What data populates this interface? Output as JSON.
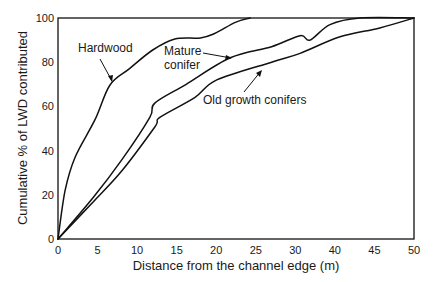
{
  "chart_data": {
    "type": "line",
    "title": "",
    "xlabel": "Distance from the channel edge (m)",
    "ylabel": "Cumulative % of LWD contributed",
    "xlim": [
      0,
      50
    ],
    "ylim": [
      0,
      100
    ],
    "grid": false,
    "legend": "none (direct annotations with arrows)",
    "x_tick_labels": [
      "0",
      "5",
      "10",
      "15",
      "20",
      "25",
      "30",
      "40",
      "45",
      "50"
    ],
    "y_tick_labels": [
      "0",
      "20",
      "40",
      "60",
      "80",
      "100"
    ],
    "series": [
      {
        "name": "Hardwood",
        "x": [
          0,
          1,
          2.4,
          5.2,
          7.3,
          10,
          13.3,
          16.4,
          20,
          22,
          24.9,
          27
        ],
        "y": [
          0,
          22,
          37,
          54,
          69.7,
          77,
          85.5,
          90.5,
          91,
          93,
          98,
          100
        ]
      },
      {
        "name": "Mature conifer",
        "x": [
          0,
          5,
          9,
          12.9,
          13.6,
          18,
          24.2,
          30,
          34,
          35.4,
          38.2,
          42.4,
          50
        ],
        "y": [
          0,
          19,
          36,
          55,
          61.5,
          70,
          82,
          87,
          92,
          90,
          97,
          100,
          100
        ]
      },
      {
        "name": "Old growth conifers",
        "x": [
          0,
          5,
          9,
          13.6,
          14.3,
          19.2,
          22.3,
          30,
          34,
          39.6,
          45.2,
          50
        ],
        "y": [
          0,
          17,
          31,
          50.7,
          55,
          64,
          72,
          80,
          84,
          91.5,
          95.5,
          100
        ]
      }
    ],
    "annotations": [
      {
        "text": "Hardwood",
        "points_to": "Hardwood curve near x=7"
      },
      {
        "text": "Mature conifer",
        "points_to": "Mature conifer curve near x=24"
      },
      {
        "text": "Old growth conifers",
        "points_to": "Old growth conifers curve near x=29"
      }
    ]
  },
  "labels": {
    "xlabel": "Distance from the channel edge (m)",
    "ylabel": "Cumulative % of LWD contributed",
    "anno_hardwood": "Hardwood",
    "anno_mature_1": "Mature",
    "anno_mature_2": "conifer",
    "anno_old": "Old growth conifers"
  }
}
